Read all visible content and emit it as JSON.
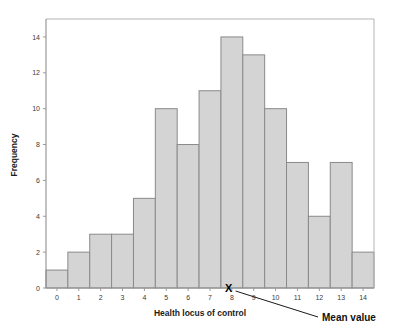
{
  "chart_data": {
    "type": "bar",
    "title": "",
    "subtitle": "",
    "xlabel": "Health locus of control",
    "ylabel": "Frequency",
    "categories": [
      "0",
      "1",
      "2",
      "3",
      "4",
      "5",
      "6",
      "7",
      "8",
      "9",
      "10",
      "11",
      "12",
      "13",
      "14"
    ],
    "values": [
      1,
      2,
      3,
      3,
      5,
      10,
      8,
      11,
      14,
      13,
      10,
      7,
      4,
      7,
      2
    ],
    "xlim": [
      -0.5,
      14.5
    ],
    "ylim": [
      0,
      15
    ],
    "ytick_labels": [
      "0",
      "2",
      "4",
      "6",
      "8",
      "10",
      "12",
      "14"
    ],
    "ytick_values": [
      0,
      2,
      4,
      6,
      8,
      10,
      12,
      14
    ],
    "xtick_labels": [
      "0",
      "1",
      "2",
      "3",
      "4",
      "5",
      "6",
      "7",
      "8",
      "9",
      "10",
      "11",
      "12",
      "13",
      "14"
    ],
    "grid": false,
    "legend": "none",
    "bar_fill_color": "#d4d4d4",
    "bar_edge_color": "#8a8a8a",
    "axis_color": "#9a9a9a",
    "annotations": [
      {
        "name": "mean-value",
        "marker": "X",
        "label": "Mean value",
        "x_value": 7.85,
        "y_value": 0
      }
    ]
  },
  "axes": {
    "y_title": "Frequency",
    "x_title": "Health locus of control"
  },
  "annotation": {
    "mean_marker_glyph": "X",
    "mean_label": "Mean value"
  }
}
